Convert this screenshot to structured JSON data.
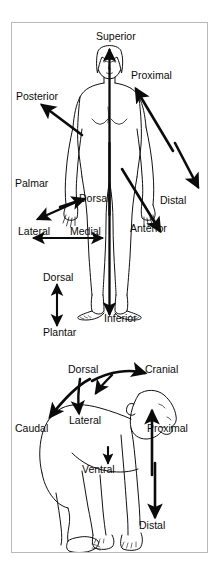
{
  "page": {
    "top_caption": "",
    "figure_title": "Anatomical directional terms",
    "background_color": "#ffffff",
    "border_color": "#b9b9bd",
    "ink_color": "#0b0b0b"
  },
  "panels": [
    {
      "id": "human-panel",
      "name": "human-figure-panel",
      "subject": "human body, anterior view, standing",
      "labels": [
        {
          "id": "superior",
          "text": "Superior",
          "x": 84,
          "y": 8,
          "arrow": "up",
          "anchor": "head"
        },
        {
          "id": "proximal",
          "text": "Proximal",
          "x": 119,
          "y": 47,
          "arrow": "up-right",
          "anchor": "arm"
        },
        {
          "id": "posterior",
          "text": "Posterior",
          "x": 4,
          "y": 68,
          "arrow": "up-left",
          "anchor": "back"
        },
        {
          "id": "palmar",
          "text": "Palmar",
          "x": 3,
          "y": 155,
          "arrow": "down-left",
          "anchor": "palm"
        },
        {
          "id": "dorsal-hand",
          "text": "Dorsal",
          "x": 67,
          "y": 170,
          "arrow": "up-right",
          "anchor": "hand-back"
        },
        {
          "id": "distal",
          "text": "Distal",
          "x": 148,
          "y": 172,
          "arrow": "down-right",
          "anchor": "hand"
        },
        {
          "id": "lateral",
          "text": "Lateral",
          "x": 6,
          "y": 203,
          "arrow": "left",
          "anchor": "side"
        },
        {
          "id": "medial",
          "text": "Medial",
          "x": 58,
          "y": 203,
          "arrow": "right",
          "anchor": "midline"
        },
        {
          "id": "anterior",
          "text": "Anterior",
          "x": 118,
          "y": 200,
          "arrow": "down-right",
          "anchor": "front"
        },
        {
          "id": "dorsal-foot",
          "text": "Dorsal",
          "x": 31,
          "y": 249,
          "arrow": "up",
          "anchor": "foot-top"
        },
        {
          "id": "inferior",
          "text": "Inferior",
          "x": 92,
          "y": 290,
          "arrow": "down",
          "anchor": "feet"
        },
        {
          "id": "plantar",
          "text": "Plantar",
          "x": 31,
          "y": 304,
          "arrow": "down",
          "anchor": "sole"
        }
      ]
    },
    {
      "id": "quadruped-panel",
      "name": "ape-figure-panel",
      "subject": "ape / chimpanzee, lateral view, quadruped stance",
      "labels": [
        {
          "id": "q-dorsal",
          "text": "Dorsal",
          "x": 56,
          "y": 341,
          "arrow": "down",
          "anchor": "back"
        },
        {
          "id": "q-cranial",
          "text": "Cranial",
          "x": 133,
          "y": 341,
          "arrow": "up-right",
          "anchor": "head"
        },
        {
          "id": "q-caudal",
          "text": "Caudal",
          "x": 3,
          "y": 400,
          "arrow": "down-left",
          "anchor": "rump"
        },
        {
          "id": "q-lateral",
          "text": "Lateral",
          "x": 57,
          "y": 392,
          "arrow": "down",
          "anchor": "flank"
        },
        {
          "id": "q-proximal",
          "text": "Proximal",
          "x": 135,
          "y": 400,
          "arrow": "up",
          "anchor": "limb-root"
        },
        {
          "id": "q-ventral",
          "text": "Ventral",
          "x": 70,
          "y": 441,
          "arrow": "down",
          "anchor": "belly"
        },
        {
          "id": "q-distal",
          "text": "Distal",
          "x": 127,
          "y": 497,
          "arrow": "down",
          "anchor": "hand"
        }
      ]
    }
  ],
  "legend": {
    "terms": [
      "Superior",
      "Inferior",
      "Anterior",
      "Posterior",
      "Medial",
      "Lateral",
      "Proximal",
      "Distal",
      "Dorsal",
      "Palmar",
      "Plantar",
      "Cranial",
      "Caudal",
      "Ventral"
    ]
  }
}
